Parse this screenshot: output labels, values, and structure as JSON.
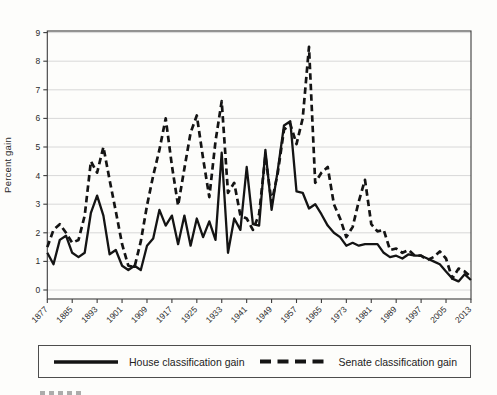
{
  "figure": {
    "ylabel": "Percent gain",
    "background_color": "#fdfdfb",
    "line_color": "#141414",
    "grid_color": "#d8d8d8",
    "frame_color": "#3c3c3c",
    "tick_text_color": "#2b2b2b"
  },
  "legend": {
    "house_label": "House classification gain",
    "senate_label": "Senate classification gain"
  },
  "chart_data": {
    "type": "line",
    "title": "",
    "xlabel": "",
    "ylabel": "Percent gain",
    "ylim": [
      0,
      9
    ],
    "yticks": [
      0,
      1,
      2,
      3,
      4,
      5,
      6,
      7,
      8,
      9
    ],
    "xticks": [
      1877,
      1885,
      1893,
      1901,
      1909,
      1917,
      1925,
      1933,
      1941,
      1949,
      1957,
      1965,
      1973,
      1981,
      1989,
      1997,
      2005,
      2013
    ],
    "grid": "horizontal",
    "legend_position": "bottom",
    "x": [
      1877,
      1879,
      1881,
      1883,
      1885,
      1887,
      1889,
      1891,
      1893,
      1895,
      1897,
      1899,
      1901,
      1903,
      1905,
      1907,
      1909,
      1911,
      1913,
      1915,
      1917,
      1919,
      1921,
      1923,
      1925,
      1927,
      1929,
      1931,
      1933,
      1935,
      1937,
      1939,
      1941,
      1943,
      1945,
      1947,
      1949,
      1951,
      1953,
      1955,
      1957,
      1959,
      1961,
      1963,
      1965,
      1967,
      1969,
      1971,
      1973,
      1975,
      1977,
      1979,
      1981,
      1983,
      1985,
      1987,
      1989,
      1991,
      1993,
      1995,
      1997,
      1999,
      2001,
      2003,
      2005,
      2007,
      2009,
      2011,
      2013
    ],
    "series": [
      {
        "name": "House classification gain",
        "style": "solid",
        "values": [
          1.3,
          0.9,
          1.75,
          1.9,
          1.3,
          1.15,
          1.3,
          2.7,
          3.3,
          2.6,
          1.25,
          1.4,
          0.85,
          0.7,
          0.85,
          0.7,
          1.55,
          1.8,
          2.8,
          2.25,
          2.6,
          1.6,
          2.6,
          1.55,
          2.5,
          1.85,
          2.4,
          1.75,
          4.8,
          1.3,
          2.5,
          2.1,
          4.3,
          2.3,
          2.25,
          4.9,
          2.8,
          4.2,
          5.75,
          5.9,
          3.45,
          3.4,
          2.85,
          3.0,
          2.65,
          2.25,
          2.0,
          1.85,
          1.55,
          1.65,
          1.55,
          1.6,
          1.6,
          1.6,
          1.3,
          1.15,
          1.2,
          1.1,
          1.25,
          1.2,
          1.2,
          1.1,
          1.0,
          0.9,
          0.65,
          0.4,
          0.3,
          0.55,
          0.35
        ]
      },
      {
        "name": "Senate classification gain",
        "style": "dashed",
        "values": [
          1.5,
          2.1,
          2.3,
          2.0,
          1.65,
          1.75,
          2.6,
          4.5,
          4.1,
          5.0,
          3.85,
          2.75,
          1.6,
          0.85,
          0.8,
          1.7,
          2.95,
          4.0,
          4.9,
          6.0,
          4.35,
          2.95,
          4.25,
          5.5,
          6.1,
          4.6,
          3.25,
          5.2,
          6.6,
          3.4,
          3.75,
          2.6,
          2.5,
          2.1,
          2.65,
          4.7,
          3.05,
          4.1,
          5.6,
          5.8,
          5.1,
          6.0,
          8.5,
          3.75,
          4.1,
          4.3,
          3.0,
          2.5,
          1.85,
          2.2,
          3.1,
          3.85,
          2.3,
          2.05,
          2.1,
          1.4,
          1.45,
          1.3,
          1.4,
          1.2,
          1.2,
          1.05,
          1.15,
          1.35,
          1.1,
          0.4,
          0.75,
          0.65,
          0.45
        ]
      }
    ]
  }
}
